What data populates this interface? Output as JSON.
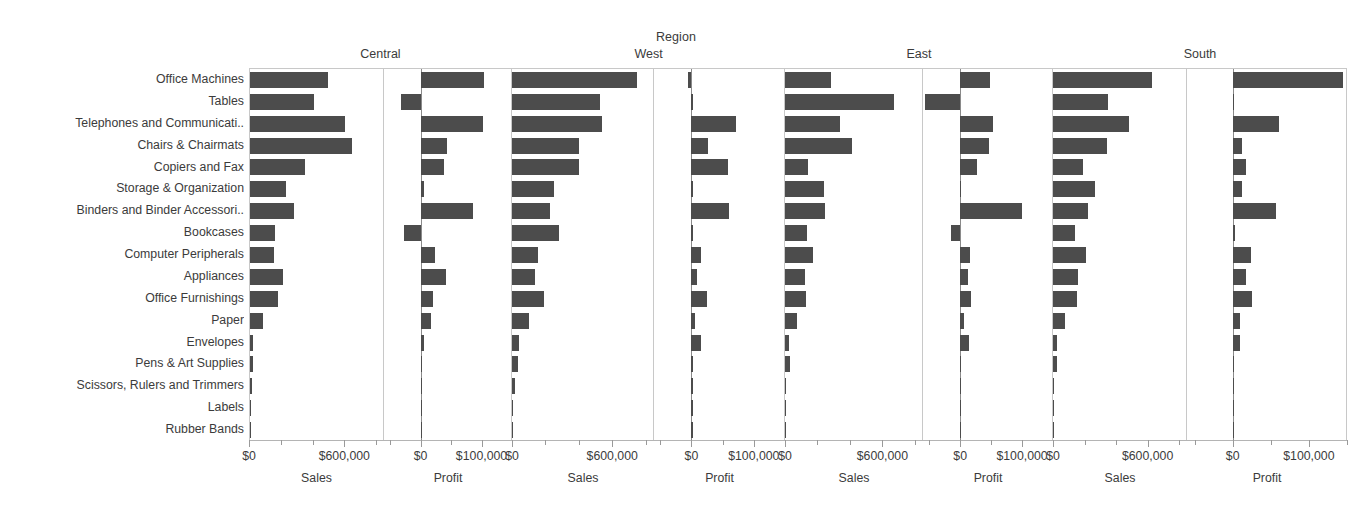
{
  "chart_data": {
    "type": "bar",
    "title": "Region",
    "orientation": "horizontal",
    "grid": false,
    "legend": null,
    "facet_row_label": "Product Sub-Category",
    "facet_column_label": "Region",
    "regions": [
      "Central",
      "West",
      "East",
      "South"
    ],
    "measures": [
      "Sales",
      "Profit"
    ],
    "categories": [
      "Office Machines",
      "Tables",
      "Telephones and Communicati..",
      "Chairs & Chairmats",
      "Copiers and Fax",
      "Storage & Organization",
      "Binders and Binder Accessori..",
      "Bookcases",
      "Computer Peripherals",
      "Appliances",
      "Office Furnishings",
      "Paper",
      "Envelopes",
      "Pens & Art Supplies",
      "Scissors, Rulers and Trimmers",
      "Labels",
      "Rubber Bands"
    ],
    "axes": {
      "sales": {
        "label": "Sales",
        "ticks": [
          0,
          600000
        ],
        "tick_labels": [
          "$0",
          "$600,000"
        ],
        "min": 0,
        "max": 850000,
        "minor_tick_step": 200000
      },
      "profit": {
        "label": "Profit",
        "ticks": [
          0,
          100000
        ],
        "tick_labels": [
          "$0",
          "$100,000"
        ],
        "min": -60000,
        "max": 150000,
        "minor_tick_step": 50000
      }
    },
    "panels": [
      {
        "region": "Central",
        "measure": "Sales",
        "values": [
          493000,
          400000,
          595000,
          645000,
          345000,
          226000,
          275000,
          157000,
          148000,
          210000,
          178000,
          80000,
          22000,
          20000,
          12000,
          4000,
          1500
        ]
      },
      {
        "region": "Central",
        "measure": "Profit",
        "values": [
          104000,
          -32000,
          103000,
          44000,
          38000,
          5000,
          86000,
          -27000,
          23000,
          42000,
          21000,
          17000,
          6000,
          1000,
          2000,
          2500,
          1000
        ]
      },
      {
        "region": "West",
        "measure": "Sales",
        "values": [
          748000,
          527000,
          541000,
          401000,
          400000,
          249000,
          230000,
          282000,
          158000,
          139000,
          189000,
          103000,
          43000,
          34000,
          17000,
          3000,
          2000
        ]
      },
      {
        "region": "West",
        "measure": "Profit",
        "values": [
          -5000,
          1000,
          72000,
          26000,
          58000,
          3000,
          61000,
          1500,
          16000,
          9000,
          25000,
          6000,
          16000,
          1500,
          1000,
          1000,
          500
        ]
      },
      {
        "region": "East",
        "measure": "Sales",
        "values": [
          281000,
          673000,
          341000,
          414000,
          144000,
          241000,
          249000,
          134000,
          171000,
          124000,
          132000,
          72000,
          26000,
          31000,
          5000,
          4000,
          2500
        ]
      },
      {
        "region": "East",
        "measure": "Profit",
        "values": [
          49000,
          -57000,
          53000,
          46000,
          28000,
          1500,
          100000,
          -14000,
          16000,
          12000,
          17000,
          6000,
          14000,
          1500,
          1500,
          1500,
          500
        ]
      },
      {
        "region": "South",
        "measure": "Sales",
        "values": [
          625000,
          350000,
          485000,
          342000,
          190000,
          268000,
          225000,
          137000,
          207000,
          156000,
          152000,
          76000,
          28000,
          26000,
          7000,
          3000,
          1500
        ]
      },
      {
        "region": "South",
        "measure": "Profit",
        "values": [
          145000,
          1500,
          61000,
          12000,
          17000,
          12000,
          57000,
          3000,
          24000,
          18000,
          25000,
          9000,
          10000,
          1000,
          1000,
          1500,
          500
        ]
      }
    ]
  }
}
